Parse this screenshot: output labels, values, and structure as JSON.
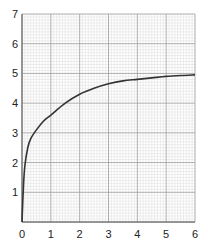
{
  "chart_data": {
    "type": "line",
    "title": "",
    "xlabel": "",
    "ylabel": "",
    "xlim": [
      0,
      6
    ],
    "ylim": [
      0,
      7
    ],
    "x_ticks": [
      "0",
      "1",
      "2",
      "3",
      "4",
      "5",
      "6"
    ],
    "y_ticks": [
      "1",
      "2",
      "3",
      "4",
      "5",
      "6",
      "7"
    ],
    "grid": {
      "major": true,
      "minor": true,
      "minor_per_major": 10
    },
    "series": [
      {
        "name": "curve",
        "color": "#333333",
        "x": [
          0,
          0.05,
          0.1,
          0.2,
          0.3,
          0.5,
          0.75,
          1,
          1.5,
          2,
          2.5,
          3,
          3.5,
          4,
          4.5,
          5,
          5.5,
          6
        ],
        "values": [
          0,
          1.2,
          1.9,
          2.5,
          2.8,
          3.1,
          3.4,
          3.6,
          4.0,
          4.3,
          4.5,
          4.65,
          4.75,
          4.8,
          4.85,
          4.9,
          4.93,
          4.95
        ]
      }
    ],
    "legend": null
  },
  "colors": {
    "minor_grid": "#dcdcdc",
    "major_grid": "#9a9a9a",
    "axis": "#555555",
    "curve": "#333333"
  }
}
